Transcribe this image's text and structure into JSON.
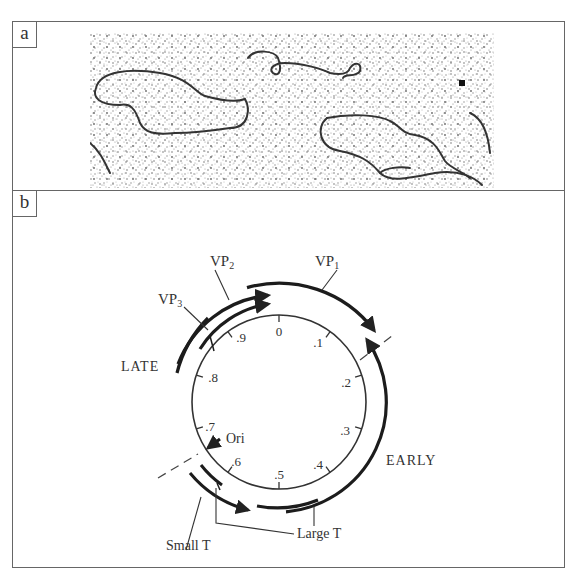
{
  "figure": {
    "panels": [
      {
        "id": "a",
        "label": "a",
        "content": "electron micrograph of circular DNA molecules"
      },
      {
        "id": "b",
        "label": "b",
        "content": "circular genome map"
      }
    ]
  },
  "map": {
    "tick_labels": [
      "0",
      ".1",
      ".2",
      ".3",
      ".4",
      ".5",
      ".6",
      ".7",
      ".8",
      ".9"
    ],
    "origin_label": "Ori",
    "region_labels": {
      "late": "LATE",
      "early": "EARLY"
    },
    "gene_labels": {
      "vp1": {
        "main": "VP",
        "sub": "1"
      },
      "vp2": {
        "main": "VP",
        "sub": "2"
      },
      "vp3": {
        "main": "VP",
        "sub": "3"
      },
      "small_t": "Small T",
      "large_t": "Large T"
    }
  },
  "colors": {
    "ink": "#222222",
    "frame": "#666666",
    "background": "#ffffff"
  }
}
